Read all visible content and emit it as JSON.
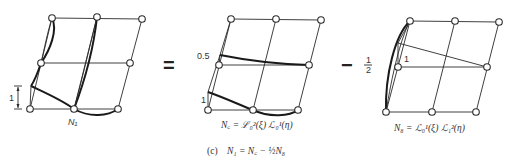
{
  "figure": {
    "caption_label": "(c)",
    "caption_equation": "N₁ = N꜀ − ½N₈",
    "operators": {
      "equals": "=",
      "minus": "−",
      "half_num": "1",
      "half_den": "2"
    },
    "panels": [
      {
        "id": "n1",
        "node_label": "N₁",
        "dimension_label": "1",
        "nodes": [
          [
            52,
            18
          ],
          [
            97,
            17
          ],
          [
            142,
            19
          ],
          [
            41,
            63
          ],
          [
            130,
            63
          ],
          [
            30,
            109
          ],
          [
            74,
            109
          ],
          [
            118,
            109
          ]
        ]
      },
      {
        "id": "nc",
        "value_labels": [
          "0.5",
          "1"
        ],
        "formula": "N꜀ = ℒ₀²(ξ) ℒ₀¹(η)",
        "nodes": [
          [
            231,
            19
          ],
          [
            276,
            19
          ],
          [
            321,
            20
          ],
          [
            219,
            65
          ],
          [
            309,
            65
          ],
          [
            208,
            110
          ],
          [
            253,
            110
          ],
          [
            298,
            110
          ]
        ]
      },
      {
        "id": "n8",
        "value_labels": [
          "1"
        ],
        "formula": "N₈ = ℒ₀¹(ξ) ℒ₁²(η)",
        "nodes": [
          [
            410,
            21
          ],
          [
            455,
            21
          ],
          [
            499,
            22
          ],
          [
            398,
            67
          ],
          [
            487,
            67
          ],
          [
            386,
            112
          ],
          [
            432,
            112
          ],
          [
            476,
            112
          ]
        ]
      }
    ]
  }
}
